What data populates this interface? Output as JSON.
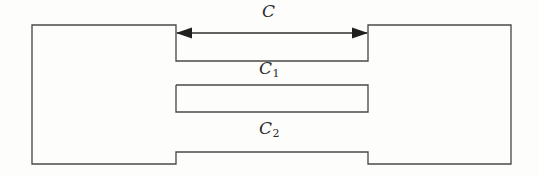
{
  "figure": {
    "background_color": "#fdfdfc",
    "line_color": "#4a4a4a",
    "arrow_color": "#1f1f1f",
    "labels": {
      "c": {
        "symbol": "C",
        "subscript": ""
      },
      "c1": {
        "symbol": "C",
        "subscript": "1"
      },
      "c2": {
        "symbol": "C",
        "subscript": "2"
      }
    },
    "shapes": {
      "outer_body": {
        "name": "notched-plate-outline",
        "points": "32,25 176,25 176,61 368,61 368,25 511,25 511,164 368,164 368,152 176,152 176,164 32,164 32,25"
      },
      "center_bar": {
        "name": "central-ligament-bar",
        "points": "176,85 368,85 368,112 176,112 176,85"
      }
    },
    "dimension_arrow": {
      "name": "crack-length-dimension-c",
      "y": 33,
      "x_start": 177,
      "x_end": 367,
      "style": "double-headed"
    }
  }
}
